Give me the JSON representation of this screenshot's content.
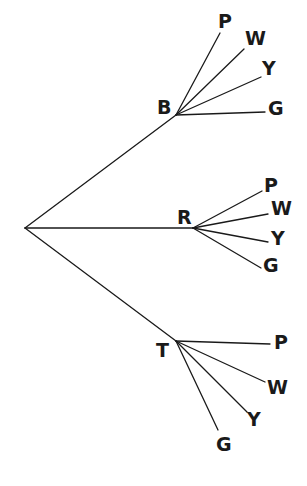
{
  "diagram": {
    "type": "tree",
    "root": {
      "id": "root",
      "x": 25,
      "y": 228,
      "label": ""
    },
    "level1": [
      {
        "id": "B",
        "label": "B",
        "x": 176,
        "y": 115,
        "label_x": 157,
        "label_y": 114,
        "children": [
          {
            "label": "P",
            "x": 220,
            "y": 33,
            "label_x": 218,
            "label_y": 28
          },
          {
            "label": "W",
            "x": 244,
            "y": 49,
            "label_x": 245,
            "label_y": 45
          },
          {
            "label": "Y",
            "x": 261,
            "y": 77,
            "label_x": 262,
            "label_y": 75
          },
          {
            "label": "G",
            "x": 265,
            "y": 112,
            "label_x": 268,
            "label_y": 115
          }
        ]
      },
      {
        "id": "R",
        "label": "R",
        "x": 193,
        "y": 228,
        "label_x": 177,
        "label_y": 224,
        "children": [
          {
            "label": "P",
            "x": 262,
            "y": 191,
            "label_x": 264,
            "label_y": 192
          },
          {
            "label": "W",
            "x": 268,
            "y": 214,
            "label_x": 271,
            "label_y": 215
          },
          {
            "label": "Y",
            "x": 268,
            "y": 242,
            "label_x": 271,
            "label_y": 245
          },
          {
            "label": "G",
            "x": 261,
            "y": 268,
            "label_x": 263,
            "label_y": 272
          }
        ]
      },
      {
        "id": "T",
        "label": "T",
        "x": 176,
        "y": 341,
        "label_x": 156,
        "label_y": 357,
        "children": [
          {
            "label": "P",
            "x": 270,
            "y": 344,
            "label_x": 274,
            "label_y": 349
          },
          {
            "label": "W",
            "x": 265,
            "y": 382,
            "label_x": 267,
            "label_y": 394
          },
          {
            "label": "Y",
            "x": 247,
            "y": 412,
            "label_x": 247,
            "label_y": 426
          },
          {
            "label": "G",
            "x": 218,
            "y": 430,
            "label_x": 216,
            "label_y": 451
          }
        ]
      }
    ]
  },
  "colors": {
    "line": "#1a1a1a",
    "text": "#1a1a1a",
    "background": "#ffffff"
  }
}
